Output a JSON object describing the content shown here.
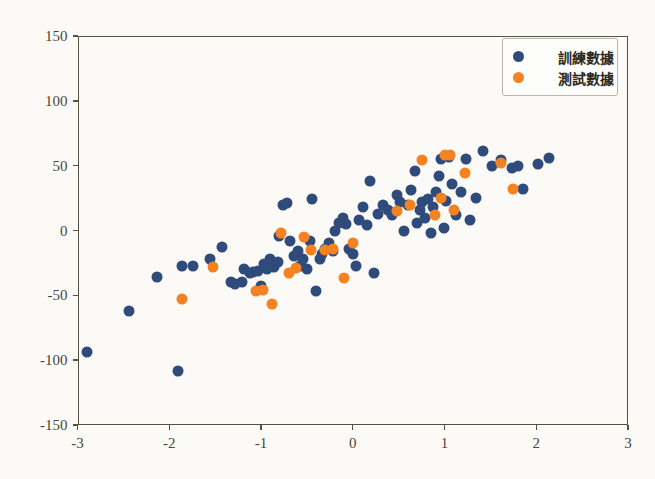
{
  "chart_data": {
    "type": "scatter",
    "title": "",
    "xlabel": "",
    "ylabel": "",
    "xlim": [
      -3,
      3
    ],
    "ylim": [
      -150,
      150
    ],
    "xticks": [
      -3,
      -2,
      -1,
      0,
      1,
      2,
      3
    ],
    "yticks": [
      -150,
      -100,
      -50,
      0,
      50,
      100,
      150
    ],
    "xtick_labels": [
      "-3",
      "-2",
      "-1",
      "0",
      "1",
      "2",
      "3"
    ],
    "ytick_labels": [
      "-150",
      "-100",
      "-50",
      "0",
      "50",
      "100",
      "150"
    ],
    "grid": false,
    "legend_position": "upper right",
    "colors": {
      "train": "#2f4b7c",
      "test": "#f58220",
      "axis": "#56523f",
      "background": "#fbfaf7",
      "tick_text": "#4a4639"
    },
    "series": [
      {
        "name": "訓練數據",
        "color": "#2f4b7c",
        "marker": "o",
        "points": [
          [
            -2.9,
            -94
          ],
          [
            -2.44,
            -62
          ],
          [
            -2.13,
            -36
          ],
          [
            -1.91,
            -108
          ],
          [
            -1.86,
            -27
          ],
          [
            -1.74,
            -27
          ],
          [
            -1.56,
            -22
          ],
          [
            -1.43,
            -13
          ],
          [
            -1.33,
            -40
          ],
          [
            -1.28,
            -41
          ],
          [
            -1.21,
            -40
          ],
          [
            -1.18,
            -30
          ],
          [
            -1.12,
            -33
          ],
          [
            -1.09,
            -32
          ],
          [
            -1.03,
            -31
          ],
          [
            -1.0,
            -43
          ],
          [
            -0.97,
            -26
          ],
          [
            -0.93,
            -30
          ],
          [
            -0.9,
            -22
          ],
          [
            -0.86,
            -28
          ],
          [
            -0.82,
            -24
          ],
          [
            -0.8,
            -4
          ],
          [
            -0.76,
            20
          ],
          [
            -0.72,
            21
          ],
          [
            -0.68,
            -8
          ],
          [
            -0.64,
            -20
          ],
          [
            -0.6,
            -16
          ],
          [
            -0.57,
            -27
          ],
          [
            -0.54,
            -22
          ],
          [
            -0.5,
            -30
          ],
          [
            -0.47,
            -8
          ],
          [
            -0.44,
            24
          ],
          [
            -0.4,
            -47
          ],
          [
            -0.36,
            -22
          ],
          [
            -0.33,
            -18
          ],
          [
            -0.3,
            -14
          ],
          [
            -0.26,
            -10
          ],
          [
            -0.22,
            -16
          ],
          [
            -0.19,
            0
          ],
          [
            -0.15,
            6
          ],
          [
            -0.11,
            10
          ],
          [
            -0.07,
            5
          ],
          [
            -0.04,
            -14
          ],
          [
            0.0,
            -18
          ],
          [
            0.03,
            -27
          ],
          [
            0.07,
            8
          ],
          [
            0.11,
            18
          ],
          [
            0.15,
            4
          ],
          [
            0.19,
            38
          ],
          [
            0.23,
            -33
          ],
          [
            0.28,
            13
          ],
          [
            0.33,
            20
          ],
          [
            0.38,
            16
          ],
          [
            0.43,
            12
          ],
          [
            0.48,
            27
          ],
          [
            0.52,
            22
          ],
          [
            0.56,
            0
          ],
          [
            0.6,
            20
          ],
          [
            0.64,
            31
          ],
          [
            0.68,
            46
          ],
          [
            0.7,
            6
          ],
          [
            0.73,
            16
          ],
          [
            0.76,
            22
          ],
          [
            0.79,
            10
          ],
          [
            0.82,
            24
          ],
          [
            0.85,
            -2
          ],
          [
            0.88,
            18
          ],
          [
            0.91,
            30
          ],
          [
            0.94,
            42
          ],
          [
            0.96,
            55
          ],
          [
            0.99,
            2
          ],
          [
            1.02,
            23
          ],
          [
            1.05,
            57
          ],
          [
            1.08,
            36
          ],
          [
            1.12,
            12
          ],
          [
            1.18,
            30
          ],
          [
            1.23,
            55
          ],
          [
            1.28,
            8
          ],
          [
            1.34,
            25
          ],
          [
            1.42,
            61
          ],
          [
            1.52,
            50
          ],
          [
            1.62,
            54
          ],
          [
            1.74,
            48
          ],
          [
            1.8,
            50
          ],
          [
            1.86,
            32
          ],
          [
            2.02,
            51
          ],
          [
            2.14,
            56
          ]
        ]
      },
      {
        "name": "測試數據",
        "color": "#f58220",
        "marker": "o",
        "points": [
          [
            -1.86,
            -53
          ],
          [
            -1.52,
            -28
          ],
          [
            -1.05,
            -47
          ],
          [
            -0.98,
            -46
          ],
          [
            -0.88,
            -57
          ],
          [
            -0.78,
            -2
          ],
          [
            -0.7,
            -33
          ],
          [
            -0.62,
            -29
          ],
          [
            -0.53,
            -5
          ],
          [
            -0.45,
            -15
          ],
          [
            -0.3,
            -15
          ],
          [
            -0.22,
            -14
          ],
          [
            -0.1,
            -37
          ],
          [
            0.0,
            -10
          ],
          [
            0.48,
            15
          ],
          [
            0.62,
            20
          ],
          [
            0.76,
            54
          ],
          [
            0.9,
            12
          ],
          [
            0.96,
            25
          ],
          [
            1.0,
            58
          ],
          [
            1.06,
            58
          ],
          [
            1.1,
            16
          ],
          [
            1.22,
            44
          ],
          [
            1.62,
            52
          ],
          [
            1.75,
            32
          ]
        ]
      }
    ]
  },
  "legend": {
    "entries": [
      {
        "label": "訓練數據",
        "series": "train"
      },
      {
        "label": "測試數據",
        "series": "test"
      }
    ]
  }
}
